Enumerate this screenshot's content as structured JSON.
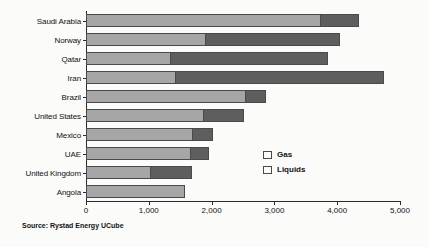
{
  "chart_data": {
    "type": "bar",
    "orientation": "horizontal",
    "stacked": true,
    "title": "",
    "xlabel": "",
    "ylabel": "",
    "xlim": [
      0,
      5000
    ],
    "grid": false,
    "legend_position": "center-right",
    "xticks": [
      "0",
      "1,000",
      "2,000",
      "3,000",
      "4,000",
      "5,000"
    ],
    "xtick_values": [
      0,
      1000,
      2000,
      3000,
      4000,
      5000
    ],
    "categories": [
      "Saudi Arabia",
      "Norway",
      "Qatar",
      "Iran",
      "Brazil",
      "United States",
      "Mexico",
      "UAE",
      "United Kingdom",
      "Angola"
    ],
    "series": [
      {
        "name": "Liquids",
        "color": "#a6a6a6",
        "values": [
          3730,
          1900,
          1340,
          1420,
          2530,
          1870,
          1690,
          1650,
          1020,
          1570
        ]
      },
      {
        "name": "Gas",
        "color": "#5e5e5e",
        "values": [
          620,
          2150,
          2520,
          3330,
          330,
          640,
          330,
          310,
          670,
          0
        ]
      }
    ],
    "totals": [
      4350,
      4050,
      3860,
      4750,
      2860,
      2510,
      2020,
      1960,
      1690,
      1570
    ],
    "legend": [
      {
        "label": "Gas",
        "color": "#5e5e5e"
      },
      {
        "label": "Liquids",
        "color": "#a6a6a6"
      }
    ]
  },
  "source": {
    "text": "Source: Rystad Energy UCube"
  }
}
